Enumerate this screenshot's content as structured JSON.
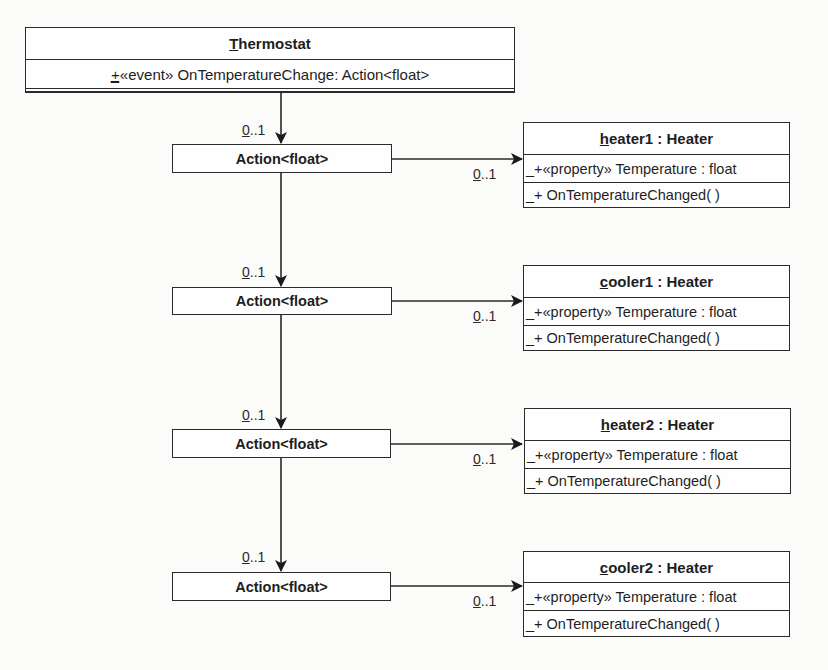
{
  "thermostat": {
    "name_first": "T",
    "name_rest": "hermostat",
    "member_vis_under": "_",
    "member_text": "+«event» OnTemperatureChange: Action<float>"
  },
  "actions": [
    {
      "label": "Action<float>",
      "in_mult_first": "0",
      "in_mult_rest": "..1",
      "out_mult_first": "0",
      "out_mult_rest": "..1"
    },
    {
      "label": "Action<float>",
      "in_mult_first": "0",
      "in_mult_rest": "..1",
      "out_mult_first": "0",
      "out_mult_rest": "..1"
    },
    {
      "label": "Action<float>",
      "in_mult_first": "0",
      "in_mult_rest": "..1",
      "out_mult_first": "0",
      "out_mult_rest": "..1"
    },
    {
      "label": "Action<float>",
      "in_mult_first": "0",
      "in_mult_rest": "..1",
      "out_mult_first": "0",
      "out_mult_rest": "..1"
    }
  ],
  "objects": [
    {
      "name_first": "h",
      "name_rest": "eater1 : Heater",
      "attribute": "_+«property» Temperature : float",
      "operation": "_+ OnTemperatureChanged(  )"
    },
    {
      "name_first": "c",
      "name_rest": "ooler1 : Heater",
      "attribute": "_+«property» Temperature : float",
      "operation": "_+ OnTemperatureChanged(  )"
    },
    {
      "name_first": "h",
      "name_rest": "eater2 : Heater",
      "attribute": "_+«property» Temperature : float",
      "operation": "_+ OnTemperatureChanged(  )"
    },
    {
      "name_first": "c",
      "name_rest": "ooler2 : Heater",
      "attribute": "_+«property» Temperature : float",
      "operation": "_+ OnTemperatureChanged(  )"
    }
  ],
  "colors": {
    "line": "#2a2a2a",
    "background": "#fbfbf9"
  }
}
